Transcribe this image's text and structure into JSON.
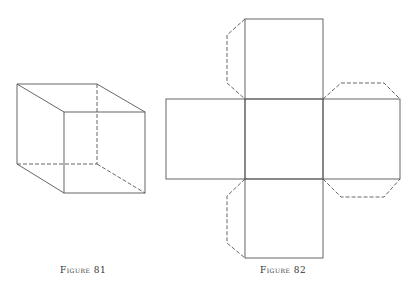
{
  "figures": [
    {
      "caption": "Figure 81",
      "subject": "cube-wireframe"
    },
    {
      "caption": "Figure 82",
      "subject": "cube-net-with-tabs"
    }
  ],
  "colors": {
    "line": "#555555",
    "background": "#ffffff"
  }
}
